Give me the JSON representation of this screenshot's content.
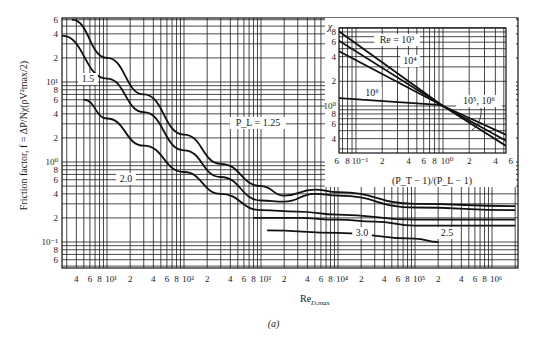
{
  "chart_data": [
    {
      "type": "line",
      "name": "main",
      "title": "",
      "xlabel": "Re_D,max",
      "ylabel": "Friction factor, f = ΔP/Nχ(ρV²max/2)",
      "xscale": "log",
      "yscale": "log",
      "xlim": [
        2.6,
        2200000
      ],
      "ylim": [
        0.047,
        63
      ],
      "grid": true,
      "x_ticks": [
        "4",
        "6",
        "8",
        "10¹",
        "2",
        "4",
        "6",
        "8",
        "10²",
        "2",
        "4",
        "6",
        "8",
        "10³",
        "2",
        "4",
        "6",
        "8",
        "10⁴",
        "2",
        "4",
        "6",
        "8",
        "10⁵",
        "2",
        "4",
        "6",
        "8",
        "10⁶"
      ],
      "y_ticks": [
        "6",
        "4",
        "2",
        "10¹",
        "8",
        "6",
        "4",
        "2",
        "10⁰",
        "8",
        "6",
        "4",
        "2",
        "10⁻¹",
        "8",
        "6"
      ],
      "series": [
        {
          "name": "P_L = 1.25",
          "x": [
            3.5,
            10,
            30,
            100,
            300,
            1000,
            2000,
            5000,
            10000,
            100000,
            2000000
          ],
          "y": [
            60,
            20,
            7,
            2.2,
            0.95,
            0.5,
            0.38,
            0.45,
            0.42,
            0.3,
            0.28
          ]
        },
        {
          "name": "1.5",
          "x": [
            2.6,
            10,
            30,
            100,
            300,
            1000,
            2000,
            5000,
            10000,
            100000,
            2000000
          ],
          "y": [
            38,
            11,
            4.2,
            1.4,
            0.65,
            0.33,
            0.32,
            0.4,
            0.38,
            0.27,
            0.25
          ]
        },
        {
          "name": "2.0",
          "x": [
            5,
            10,
            30,
            100,
            300,
            1000,
            3000,
            10000,
            100000,
            2000000
          ],
          "y": [
            6,
            3.5,
            1.6,
            0.75,
            0.4,
            0.25,
            0.24,
            0.22,
            0.19,
            0.19
          ]
        },
        {
          "name": "2.5",
          "x": [
            800,
            3000,
            10000,
            30000,
            100000,
            2000000
          ],
          "y": [
            0.2,
            0.2,
            0.19,
            0.18,
            0.16,
            0.16
          ]
        },
        {
          "name": "3.0",
          "x": [
            1200,
            10000,
            100000,
            200000
          ],
          "y": [
            0.14,
            0.13,
            0.11,
            0.1
          ]
        }
      ],
      "annotations": [
        "P_L = 1.25",
        "1.5",
        "2.0",
        "2.5",
        "3.0"
      ]
    },
    {
      "type": "line",
      "name": "inset",
      "xlabel": "(P_T − 1)/(P_L − 1)",
      "ylabel": "χ",
      "xscale": "log",
      "yscale": "log",
      "xlim": [
        0.055,
        6
      ],
      "ylim": [
        0.3,
        9
      ],
      "x_ticks": [
        "6",
        "8",
        "10⁻¹",
        "2",
        "4",
        "6",
        "8",
        "10⁰",
        "2",
        "4",
        "6"
      ],
      "y_ticks": [
        "8",
        "6",
        "4",
        "2",
        "10⁰",
        "8",
        "6",
        "4"
      ],
      "series": [
        {
          "name": "Re = 10³",
          "x": [
            0.06,
            1.0,
            6.0
          ],
          "y": [
            8.5,
            1.0,
            0.3
          ]
        },
        {
          "name": "10⁴",
          "x": [
            0.06,
            1.0,
            6.0
          ],
          "y": [
            6.5,
            1.0,
            0.35
          ]
        },
        {
          "name": "10⁵, 10⁶",
          "x": [
            0.06,
            1.0,
            6.0
          ],
          "y": [
            4.8,
            1.0,
            0.42
          ]
        },
        {
          "name": "10⁶",
          "x": [
            0.06,
            0.9,
            1.0
          ],
          "y": [
            1.25,
            1.03,
            1.0
          ]
        }
      ],
      "annotations": [
        "Re = 10³",
        "10⁴",
        "10⁶",
        "10⁵, 10⁶"
      ]
    }
  ],
  "labels": {
    "ylabel": "Friction factor, f = ΔP/Nχ(ρV²max/2)",
    "xlabel_base": "Re",
    "xlabel_sub": "D,max",
    "caption": "(a)",
    "inset_ylabel": "χ",
    "inset_xlabel": "(P_T − 1)/(P_L − 1)",
    "curve_125": "P_L = 1.25",
    "curve_15": "1.5",
    "curve_20": "2.0",
    "curve_25": "2.5",
    "curve_30": "3.0",
    "inset_re3": "Re = 10³",
    "inset_re4": "10⁴",
    "inset_re6": "10⁶",
    "inset_re56": "10⁵, 10⁶"
  }
}
